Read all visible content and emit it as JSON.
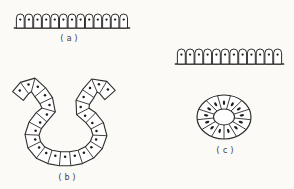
{
  "figure": {
    "background": "#fbfaf7",
    "ink_color": "#2f2d2b",
    "nucleus_color": "#1d1c1b",
    "cell_fill": "#ffffff",
    "label_color": "#45433f",
    "panels": [
      {
        "id": "row-a",
        "label": "(a)",
        "type": "row",
        "description": "flat surface epithelium row of dome-topped cells with nuclei",
        "cell_count": 13,
        "geometry": {
          "x": 16,
          "y": 14,
          "width": 112,
          "height": 14,
          "dome_radius": 4.2
        },
        "label_pos": {
          "x": 70,
          "y": 38
        }
      },
      {
        "id": "row-right",
        "label": "",
        "type": "row",
        "description": "second flat surface epithelium row, unlabeled",
        "cell_count": 12,
        "geometry": {
          "x": 177,
          "y": 49,
          "width": 105,
          "height": 15,
          "dome_radius": 4.2
        },
        "label_pos": null
      },
      {
        "id": "invagination-b",
        "label": "(b)",
        "type": "band",
        "description": "U-shaped invaginating epithelial pocket with outward-curled lips",
        "cell_count": 25,
        "geometry": {
          "half_thickness": 7,
          "control_points": [
            [
              18,
              96
            ],
            [
              31,
              84
            ],
            [
              45,
              99
            ],
            [
              49,
              109
            ],
            [
              38,
              121
            ],
            [
              32,
              134
            ],
            [
              36,
              148
            ],
            [
              47,
              156
            ],
            [
              65,
              159
            ],
            [
              83,
              156
            ],
            [
              95,
              147
            ],
            [
              100,
              133
            ],
            [
              93,
              120
            ],
            [
              81,
              109
            ],
            [
              85,
              99
            ],
            [
              97,
              84
            ],
            [
              110,
              95
            ]
          ]
        },
        "label_pos": {
          "x": 68,
          "y": 177
        }
      },
      {
        "id": "ring-c",
        "label": "(c)",
        "type": "ring",
        "description": "closed ring of radial cells around a central lumen (follicle cross-section)",
        "cell_count": 13,
        "geometry": {
          "cx": 224,
          "cy": 117,
          "outer_rx": 27,
          "outer_ry": 22,
          "inner_rx": 10.5,
          "inner_ry": 8
        },
        "label_pos": {
          "x": 226,
          "y": 150
        }
      }
    ]
  }
}
